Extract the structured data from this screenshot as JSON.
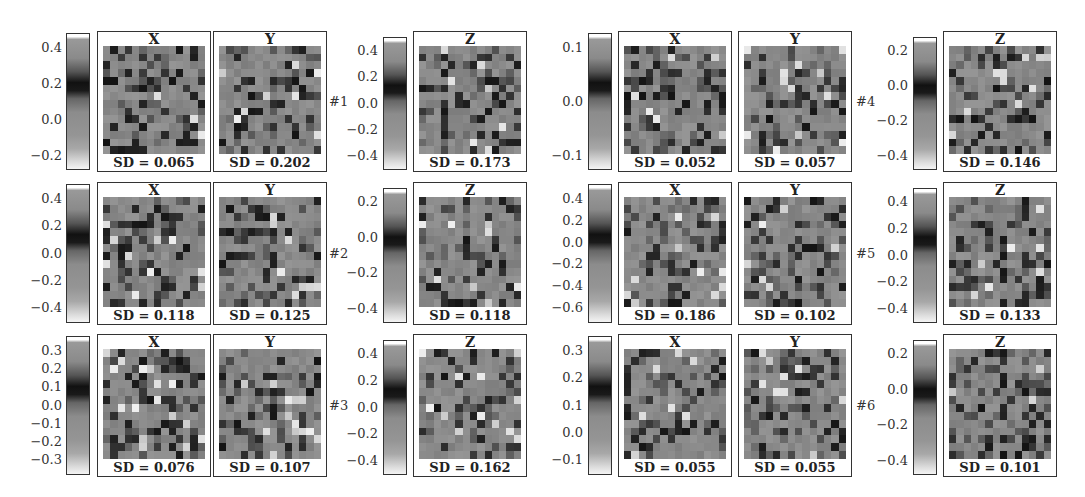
{
  "chart_data": {
    "type": "heatmap",
    "title": "",
    "colormap": "grayscale: light gray (low) -> mid gray -> black (peak) -> gray -> white (high)",
    "examples": [
      {
        "label": "#1",
        "xy_colorbar": {
          "ticks": [
            "0.4",
            "0.2",
            "0.0",
            "−0.2"
          ],
          "range": [
            -0.3,
            0.5
          ]
        },
        "z_colorbar": {
          "ticks": [
            "0.4",
            "0.2",
            "0.0",
            "−0.2",
            "−0.4"
          ],
          "range": [
            -0.45,
            0.5
          ]
        },
        "maps": [
          {
            "component": "X",
            "sd": "SD = 0.065"
          },
          {
            "component": "Y",
            "sd": "SD = 0.202"
          },
          {
            "component": "Z",
            "sd": "SD = 0.173"
          }
        ]
      },
      {
        "label": "#2",
        "xy_colorbar": {
          "ticks": [
            "0.4",
            "0.2",
            "0.0",
            "−0.2",
            "−0.4"
          ],
          "range": [
            -0.45,
            0.5
          ]
        },
        "z_colorbar": {
          "ticks": [
            "0.2",
            "0.0",
            "−0.2",
            "−0.4"
          ],
          "range": [
            -0.5,
            0.35
          ]
        },
        "maps": [
          {
            "component": "X",
            "sd": "SD = 0.118"
          },
          {
            "component": "Y",
            "sd": "SD = 0.125"
          },
          {
            "component": "Z",
            "sd": "SD = 0.118"
          }
        ]
      },
      {
        "label": "#3",
        "xy_colorbar": {
          "ticks": [
            "0.3",
            "0.2",
            "0.1",
            "0.0",
            "−0.1",
            "−0.2",
            "−0.3"
          ],
          "range": [
            -0.35,
            0.3
          ]
        },
        "z_colorbar": {
          "ticks": [
            "0.4",
            "0.2",
            "0.0",
            "−0.2",
            "−0.4"
          ],
          "range": [
            -0.45,
            0.45
          ]
        },
        "maps": [
          {
            "component": "X",
            "sd": "SD = 0.076"
          },
          {
            "component": "Y",
            "sd": "SD = 0.107"
          },
          {
            "component": "Z",
            "sd": "SD = 0.162"
          }
        ]
      },
      {
        "label": "#4",
        "xy_colorbar": {
          "ticks": [
            "0.1",
            "0.0",
            "−0.1"
          ],
          "range": [
            -0.18,
            0.13
          ]
        },
        "z_colorbar": {
          "ticks": [
            "0.2",
            "0.0",
            "−0.2",
            "−0.4"
          ],
          "range": [
            -0.45,
            0.3
          ]
        },
        "maps": [
          {
            "component": "X",
            "sd": "SD = 0.052"
          },
          {
            "component": "Y",
            "sd": "SD = 0.057"
          },
          {
            "component": "Z",
            "sd": "SD = 0.146"
          }
        ]
      },
      {
        "label": "#5",
        "xy_colorbar": {
          "ticks": [
            "0.4",
            "0.2",
            "0.0",
            "−0.2",
            "−0.4",
            "−0.6"
          ],
          "range": [
            -0.6,
            0.5
          ]
        },
        "z_colorbar": {
          "ticks": [
            "0.4",
            "0.2",
            "0.0",
            "−0.2",
            "−0.4"
          ],
          "range": [
            -0.45,
            0.45
          ]
        },
        "maps": [
          {
            "component": "X",
            "sd": "SD = 0.186"
          },
          {
            "component": "Y",
            "sd": "SD = 0.102"
          },
          {
            "component": "Z",
            "sd": "SD = 0.133"
          }
        ]
      },
      {
        "label": "#6",
        "xy_colorbar": {
          "ticks": [
            "0.3",
            "0.2",
            "0.1",
            "0.0",
            "−0.1"
          ],
          "range": [
            -0.12,
            0.32
          ]
        },
        "z_colorbar": {
          "ticks": [
            "0.2",
            "0.0",
            "−0.2",
            "−0.4"
          ],
          "range": [
            -0.45,
            0.3
          ]
        },
        "maps": [
          {
            "component": "X",
            "sd": "SD = 0.055"
          },
          {
            "component": "Y",
            "sd": "SD = 0.055"
          },
          {
            "component": "Z",
            "sd": "SD = 0.101"
          }
        ]
      }
    ],
    "grid": false,
    "legend_position": "colorbar left of each group"
  }
}
